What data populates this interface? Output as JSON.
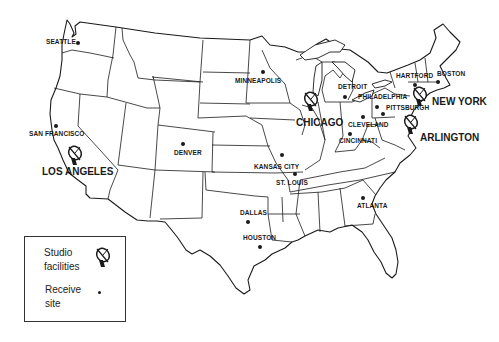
{
  "map": {
    "title": "Network studio facilities and receive sites",
    "region": "Contiguous United States",
    "studio_facilities": [
      {
        "name": "LOS ANGELES",
        "x": 73,
        "y": 158,
        "label_x": 42,
        "label_y": 167
      },
      {
        "name": "CHICAGO",
        "x": 309,
        "y": 103,
        "label_x": 296,
        "label_y": 118
      },
      {
        "name": "NEW YORK",
        "x": 416,
        "y": 93,
        "label_x": 432,
        "label_y": 97
      },
      {
        "name": "ARLINGTON",
        "x": 409,
        "y": 124,
        "label_x": 420,
        "label_y": 133
      }
    ],
    "receive_sites": [
      {
        "name": "SEATTLE",
        "x": 78,
        "y": 43,
        "label_x": 46,
        "label_y": 39
      },
      {
        "name": "SAN FRANCISCO",
        "x": 56,
        "y": 126,
        "label_x": 29,
        "label_y": 132
      },
      {
        "name": "DENVER",
        "x": 183,
        "y": 144,
        "label_x": 174,
        "label_y": 150
      },
      {
        "name": "MINNEAPOLIS",
        "x": 263,
        "y": 72,
        "label_x": 235,
        "label_y": 78
      },
      {
        "name": "KANSAS CITY",
        "x": 282,
        "y": 155,
        "label_x": 254,
        "label_y": 166
      },
      {
        "name": "ST. LOUIS",
        "x": 295,
        "y": 174,
        "label_x": 276,
        "label_y": 180
      },
      {
        "name": "DETROIT",
        "x": 345,
        "y": 97,
        "label_x": 338,
        "label_y": 83
      },
      {
        "name": "CLEVELAND",
        "x": 363,
        "y": 117,
        "label_x": 349,
        "label_y": 123
      },
      {
        "name": "CINCINNATI",
        "x": 350,
        "y": 134,
        "label_x": 338,
        "label_y": 140
      },
      {
        "name": "PHILADELPHIA",
        "x": 377,
        "y": 107,
        "label_x": 358,
        "label_y": 94
      },
      {
        "name": "PITTSBURGH",
        "x": 383,
        "y": 114,
        "label_x": 386,
        "label_y": 106
      },
      {
        "name": "HARTFORD",
        "x": 415,
        "y": 85,
        "label_x": 396,
        "label_y": 73
      },
      {
        "name": "BOSTON",
        "x": 438,
        "y": 82,
        "label_x": 437,
        "label_y": 71
      },
      {
        "name": "DALLAS",
        "x": 248,
        "y": 222,
        "label_x": 240,
        "label_y": 210
      },
      {
        "name": "HOUSTON",
        "x": 260,
        "y": 247,
        "label_x": 243,
        "label_y": 236
      },
      {
        "name": "ATLANTA",
        "x": 363,
        "y": 198,
        "label_x": 356,
        "label_y": 204
      }
    ]
  },
  "legend": {
    "studio_label_line1": "Studio",
    "studio_label_line2": "facilities",
    "studio_icon": "satellite-dish-icon",
    "receive_label_line1": "Receive",
    "receive_label_line2": "site",
    "receive_icon": "dot-icon"
  },
  "colors": {
    "ink": "#1a1a1a",
    "background": "#ffffff"
  }
}
